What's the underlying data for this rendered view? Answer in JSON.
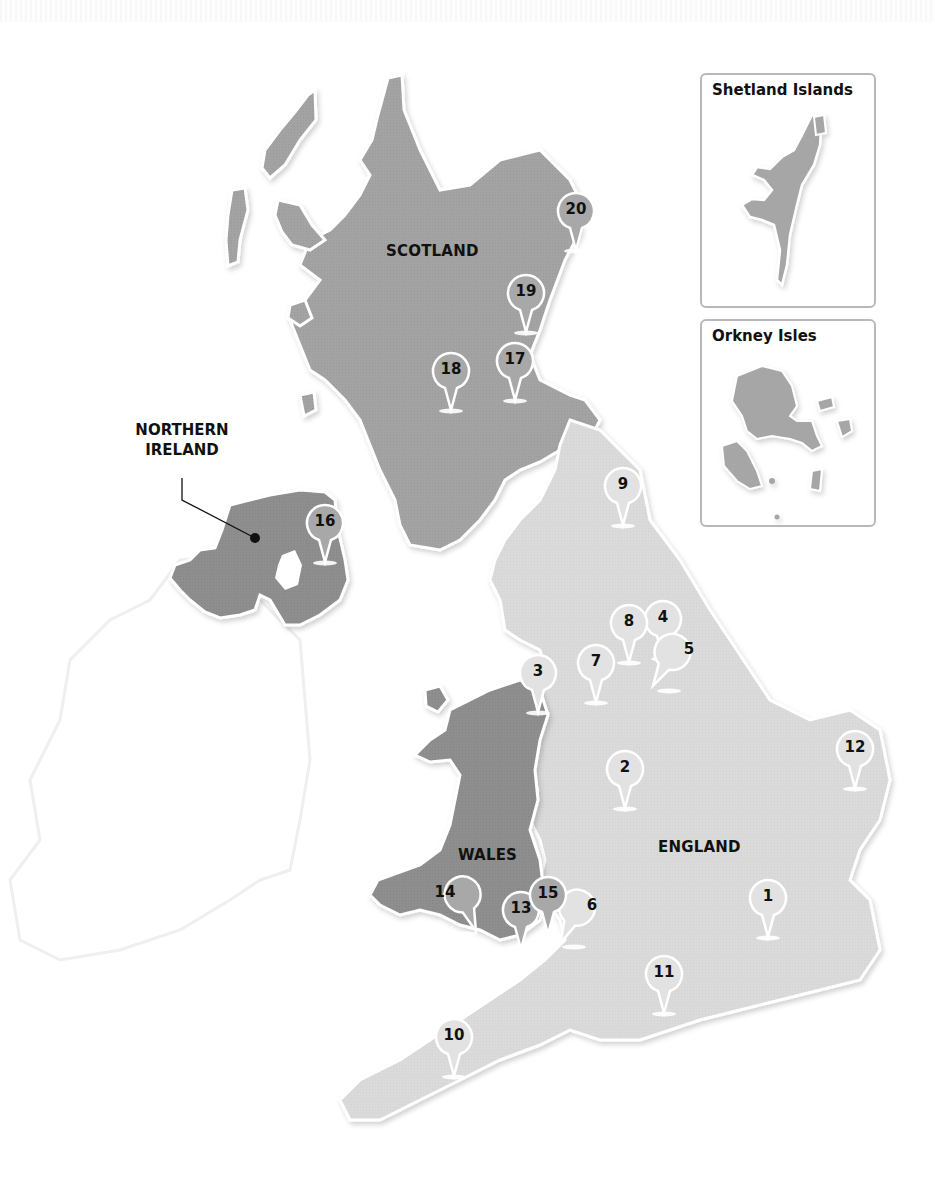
{
  "map": {
    "type": "regional-map",
    "subject": "United Kingdom",
    "colors": {
      "scotland": "#a3a3a3",
      "england": "#dadada",
      "wales": "#8e8e8e",
      "northern_ireland": "#8e8e8e",
      "ireland_outline": "#eeeeee",
      "pin_fill_dark_region": "#a8a8a8",
      "pin_fill_light_region": "#e2e2e2",
      "pin_outline": "#ffffff",
      "inset_border": "#b9b9b9",
      "label": "#111111"
    },
    "regions": {
      "scotland": "SCOTLAND",
      "england": "ENGLAND",
      "wales": "WALES",
      "northern_ireland_line1": "NORTHERN",
      "northern_ireland_line2": "IRELAND"
    },
    "insets": {
      "shetland": "Shetland Islands",
      "orkney": "Orkney Isles"
    },
    "pins": [
      {
        "id": 1,
        "label": "1",
        "region": "England"
      },
      {
        "id": 2,
        "label": "2",
        "region": "England"
      },
      {
        "id": 3,
        "label": "3",
        "region": "England"
      },
      {
        "id": 4,
        "label": "4",
        "region": "England"
      },
      {
        "id": 5,
        "label": "5",
        "region": "England"
      },
      {
        "id": 6,
        "label": "6",
        "region": "England"
      },
      {
        "id": 7,
        "label": "7",
        "region": "England"
      },
      {
        "id": 8,
        "label": "8",
        "region": "England"
      },
      {
        "id": 9,
        "label": "9",
        "region": "England"
      },
      {
        "id": 10,
        "label": "10",
        "region": "England"
      },
      {
        "id": 11,
        "label": "11",
        "region": "England"
      },
      {
        "id": 12,
        "label": "12",
        "region": "England"
      },
      {
        "id": 13,
        "label": "13",
        "region": "Wales"
      },
      {
        "id": 14,
        "label": "14",
        "region": "Wales"
      },
      {
        "id": 15,
        "label": "15",
        "region": "Wales"
      },
      {
        "id": 16,
        "label": "16",
        "region": "Northern Ireland"
      },
      {
        "id": 17,
        "label": "17",
        "region": "Scotland"
      },
      {
        "id": 18,
        "label": "18",
        "region": "Scotland"
      },
      {
        "id": 19,
        "label": "19",
        "region": "Scotland"
      },
      {
        "id": 20,
        "label": "20",
        "region": "Scotland"
      }
    ]
  }
}
